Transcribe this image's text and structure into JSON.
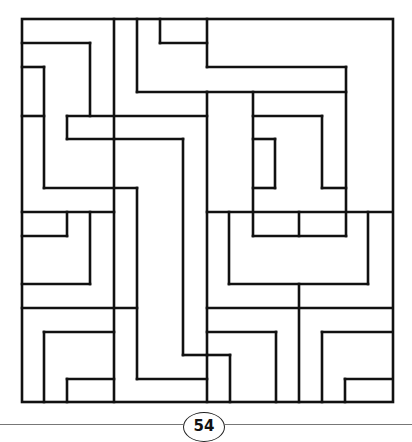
{
  "page": {
    "number": "54"
  },
  "maze": {
    "stroke_color": "#111111",
    "stroke_width": 2.6,
    "border": {
      "x": 22,
      "y": 19,
      "width": 371,
      "height": 383
    },
    "segments": [
      [
        22,
        43,
        90,
        43
      ],
      [
        90,
        43,
        90,
        116
      ],
      [
        22,
        67,
        44,
        67
      ],
      [
        44,
        67,
        44,
        188
      ],
      [
        22,
        116,
        44,
        116
      ],
      [
        114,
        19,
        114,
        402
      ],
      [
        137,
        19,
        137,
        92
      ],
      [
        137,
        92,
        207,
        92
      ],
      [
        160,
        19,
        160,
        43
      ],
      [
        160,
        43,
        207,
        43
      ],
      [
        207,
        19,
        207,
        67
      ],
      [
        207,
        67,
        346,
        67
      ],
      [
        346,
        67,
        346,
        236
      ],
      [
        207,
        92,
        346,
        92
      ],
      [
        207,
        92,
        207,
        402
      ],
      [
        67,
        116,
        207,
        116
      ],
      [
        67,
        116,
        67,
        139
      ],
      [
        67,
        139,
        114,
        139
      ],
      [
        114,
        139,
        183,
        139
      ],
      [
        183,
        139,
        183,
        355
      ],
      [
        183,
        355,
        207,
        355
      ],
      [
        44,
        188,
        137,
        188
      ],
      [
        137,
        188,
        137,
        379
      ],
      [
        137,
        379,
        207,
        379
      ],
      [
        22,
        212,
        114,
        212
      ],
      [
        67,
        212,
        67,
        236
      ],
      [
        22,
        236,
        67,
        236
      ],
      [
        90,
        212,
        90,
        284
      ],
      [
        22,
        284,
        90,
        284
      ],
      [
        22,
        308,
        137,
        308
      ],
      [
        44,
        332,
        114,
        332
      ],
      [
        44,
        332,
        44,
        402
      ],
      [
        67,
        379,
        114,
        379
      ],
      [
        67,
        379,
        67,
        402
      ],
      [
        207,
        308,
        392,
        308
      ],
      [
        207,
        332,
        276,
        332
      ],
      [
        276,
        332,
        276,
        402
      ],
      [
        207,
        355,
        230,
        355
      ],
      [
        230,
        355,
        230,
        402
      ],
      [
        229,
        212,
        229,
        284
      ],
      [
        229,
        284,
        368,
        284
      ],
      [
        368,
        212,
        368,
        284
      ],
      [
        299,
        284,
        299,
        402
      ],
      [
        299,
        212,
        299,
        236
      ],
      [
        322,
        332,
        392,
        332
      ],
      [
        322,
        332,
        322,
        402
      ],
      [
        345,
        379,
        392,
        379
      ],
      [
        345,
        379,
        345,
        402
      ],
      [
        253,
        92,
        253,
        236
      ],
      [
        253,
        116,
        322,
        116
      ],
      [
        322,
        116,
        322,
        188
      ],
      [
        322,
        188,
        346,
        188
      ],
      [
        253,
        139,
        275,
        139
      ],
      [
        275,
        139,
        275,
        188
      ],
      [
        253,
        188,
        275,
        188
      ],
      [
        207,
        212,
        392,
        212
      ],
      [
        253,
        236,
        346,
        236
      ]
    ]
  },
  "footer": {
    "line_left": {
      "x": 0,
      "width": 183
    },
    "line_right": {
      "x": 225,
      "width": 187
    }
  }
}
